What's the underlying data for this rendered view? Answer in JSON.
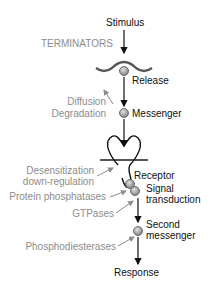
{
  "diagram": {
    "main_path": {
      "stimulus": "Stimulus",
      "release": "Release",
      "messenger": "Messenger",
      "receptor": "Receptor",
      "signal_transduction_line1": "Signal",
      "signal_transduction_line2": "transduction",
      "second_messenger_line1": "Second",
      "second_messenger_line2": "messenger",
      "response": "Response"
    },
    "terminators": {
      "heading": "TERMINATORS",
      "diffusion": "Diffusion",
      "degradation": "Degradation",
      "desensitization": "Desensitization",
      "down_regulation": "down-regulation",
      "protein_phosphatases": "Protein phosphatases",
      "gtpases": "GTPases",
      "phosphodiesterases": "Phosphodiesterases"
    },
    "colors": {
      "main": "#111111",
      "terminator": "#8c8c8c",
      "node_fill": "#a8a8a8",
      "membrane": "#555555"
    }
  }
}
